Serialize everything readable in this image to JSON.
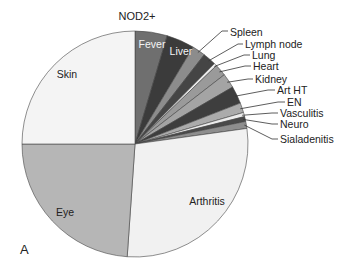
{
  "chart_data": {
    "type": "pie",
    "title": "NOD2+",
    "panel_label": "A",
    "start_angle_deg": 0,
    "direction": "clockwise",
    "slices": [
      {
        "label": "Fever",
        "pct": 4.6,
        "color": "#6f6f6f",
        "label_style": "inside-white"
      },
      {
        "label": "Liver",
        "pct": 4.0,
        "color": "#3b3b3b",
        "label_style": "inside-white"
      },
      {
        "label": "Spleen",
        "pct": 1.9,
        "color": "#8c8c8c",
        "label_style": "outside"
      },
      {
        "label": "Lymph node",
        "pct": 1.9,
        "color": "#454545",
        "label_style": "outside"
      },
      {
        "label": "Lung",
        "pct": 0.4,
        "color": "#efefef",
        "label_style": "outside"
      },
      {
        "label": "Heart",
        "pct": 1.7,
        "color": "#9a9a9a",
        "label_style": "outside"
      },
      {
        "label": "Kidney",
        "pct": 2.1,
        "color": "#a4a4a4",
        "label_style": "outside"
      },
      {
        "label": "Art HT",
        "pct": 2.5,
        "color": "#3e3e3e",
        "label_style": "outside"
      },
      {
        "label": "EN",
        "pct": 1.4,
        "color": "#ababab",
        "label_style": "outside"
      },
      {
        "label": "Vasculitis",
        "pct": 0.6,
        "color": "#ececec",
        "label_style": "outside"
      },
      {
        "label": "Neuro",
        "pct": 0.7,
        "color": "#4a4a4a",
        "label_style": "outside"
      },
      {
        "label": "Sialadenitis",
        "pct": 1.0,
        "color": "#8e8e8e",
        "label_style": "outside"
      },
      {
        "label": "Arthritis",
        "pct": 28.3,
        "color": "#f1f1f1",
        "label_style": "inside"
      },
      {
        "label": "Eye",
        "pct": 23.9,
        "color": "#b6b6b6",
        "label_style": "inside"
      },
      {
        "label": "Skin",
        "pct": 25.0,
        "color": "#f4f4f4",
        "label_style": "inside"
      }
    ],
    "legend": "none (leader-line labels)"
  },
  "layout": {
    "center": [
      135,
      144
    ],
    "radius": 113,
    "inside_labels": {
      "Fever": [
        152,
        48
      ],
      "Liver": [
        181,
        55
      ],
      "Arthritis": [
        207,
        205
      ],
      "Eye": [
        65,
        216
      ],
      "Skin": [
        67,
        78
      ]
    },
    "outside_labels": {
      "Spleen": {
        "text": [
          230,
          36
        ],
        "elbow": [
          222,
          31
        ],
        "rim_deg": 34.5
      },
      "Lymph node": {
        "text": [
          245,
          48
        ],
        "elbow": [
          238,
          44
        ],
        "rim_deg": 41.5
      },
      "Lung": {
        "text": [
          252,
          59
        ],
        "elbow": [
          244,
          55
        ],
        "rim_deg": 45.7
      },
      "Heart": {
        "text": [
          253,
          70
        ],
        "elbow": [
          245,
          66
        ],
        "rim_deg": 49.5
      },
      "Kidney": {
        "text": [
          255,
          83
        ],
        "elbow": [
          248,
          79
        ],
        "rim_deg": 56.2
      },
      "Art HT": {
        "text": [
          277,
          94
        ],
        "elbow": [
          268,
          90
        ],
        "rim_deg": 64.5
      },
      "EN": {
        "text": [
          287,
          106
        ],
        "elbow": [
          278,
          102
        ],
        "rim_deg": 71.5
      },
      "Vasculitis": {
        "text": [
          280,
          117
        ],
        "elbow": [
          272,
          113
        ],
        "rim_deg": 75
      },
      "Neuro": {
        "text": [
          280,
          128
        ],
        "elbow": [
          272,
          124
        ],
        "rim_deg": 77.2
      },
      "Sialadenitis": {
        "text": [
          280,
          143
        ],
        "elbow": [
          272,
          139
        ],
        "rim_deg": 80.2
      }
    }
  }
}
